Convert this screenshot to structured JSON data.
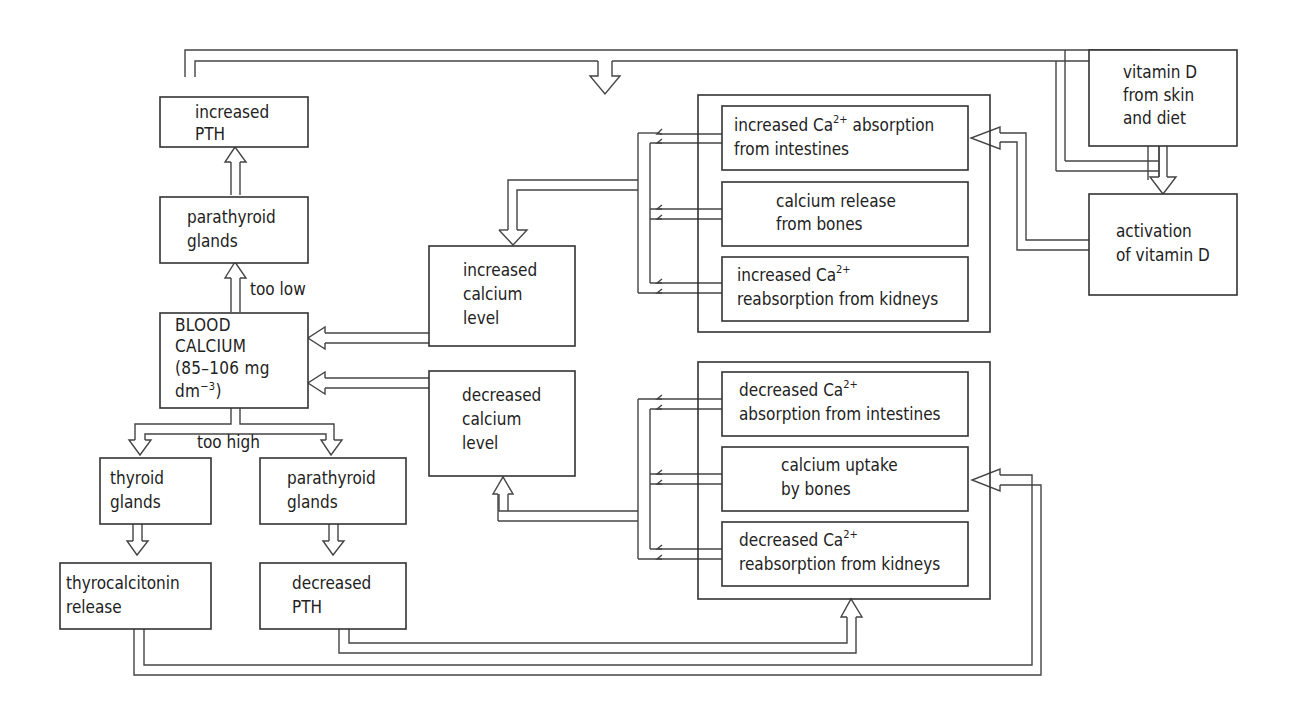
{
  "diagram": {
    "colors": {
      "line": "#444444",
      "box_border": "#333333",
      "text": "#222222",
      "background": "#ffffff"
    },
    "nodes": {
      "increased_pth": {
        "lines": [
          "increased",
          "PTH"
        ]
      },
      "parathyroid_glands_top": {
        "lines": [
          "parathyroid",
          "glands"
        ]
      },
      "blood_calcium": {
        "lines": [
          "BLOOD",
          "CALCIUM",
          "(85–106 mg",
          "dm"
        ],
        "superscript": "−3",
        "suffix": ")"
      },
      "thyroid_glands": {
        "lines": [
          "thyroid",
          "glands"
        ]
      },
      "parathyroid_glands_bottom": {
        "lines": [
          "parathyroid",
          "glands"
        ]
      },
      "thyrocalcitonin_release": {
        "lines": [
          "thyrocalcitonin",
          "release"
        ]
      },
      "decreased_pth": {
        "lines": [
          "decreased",
          "PTH"
        ]
      },
      "increased_calcium_level": {
        "lines": [
          "increased",
          "calcium",
          "level"
        ]
      },
      "decreased_calcium_level": {
        "lines": [
          "decreased",
          "calcium",
          "level"
        ]
      },
      "increased_absorption_intestines": {
        "line1_pre": "increased Ca",
        "line1_sup": "2+",
        "line1_post": " absorption",
        "line2": "from  intestines"
      },
      "calcium_release_bones": {
        "lines": [
          "calcium release",
          "from bones"
        ]
      },
      "increased_reabsorption_kidneys": {
        "line1_pre": "increased Ca",
        "line1_sup": "2+",
        "line2": "reabsorption from kidneys"
      },
      "decreased_absorption_intestines": {
        "line1_pre": "decreased Ca",
        "line1_sup": "2+",
        "line2": "absorption from intestines"
      },
      "calcium_uptake_bones": {
        "lines": [
          "calcium uptake",
          "by bones"
        ]
      },
      "decreased_reabsorption_kidneys": {
        "line1_pre": "decreased Ca",
        "line1_sup": "2+",
        "line2": "reabsorption from kidneys"
      },
      "vitamin_d_source": {
        "lines": [
          "vitamin D",
          "from skin",
          "and diet"
        ]
      },
      "activation_vitamin_d": {
        "lines": [
          "activation",
          "of vitamin D"
        ]
      }
    },
    "labels": {
      "too_low": "too low",
      "too_high": "too high"
    },
    "edges": [
      {
        "from": "blood_calcium",
        "to": "parathyroid_glands_top",
        "label": "too low"
      },
      {
        "from": "parathyroid_glands_top",
        "to": "increased_pth"
      },
      {
        "from": "increased_pth",
        "to": "increase_group"
      },
      {
        "from": "increased_pth",
        "to": "activation_vitamin_d"
      },
      {
        "from": "vitamin_d_source",
        "to": "activation_vitamin_d"
      },
      {
        "from": "activation_vitamin_d",
        "to": "increased_absorption_intestines"
      },
      {
        "from": "increase_group",
        "to": "increased_calcium_level"
      },
      {
        "from": "increased_calcium_level",
        "to": "blood_calcium"
      },
      {
        "from": "blood_calcium",
        "to": "thyroid_glands",
        "label": "too high"
      },
      {
        "from": "blood_calcium",
        "to": "parathyroid_glands_bottom",
        "label": "too high"
      },
      {
        "from": "thyroid_glands",
        "to": "thyrocalcitonin_release"
      },
      {
        "from": "parathyroid_glands_bottom",
        "to": "decreased_pth"
      },
      {
        "from": "decreased_pth",
        "to": "decrease_group"
      },
      {
        "from": "thyrocalcitonin_release",
        "to": "calcium_uptake_bones"
      },
      {
        "from": "decrease_group",
        "to": "decreased_calcium_level"
      },
      {
        "from": "decreased_calcium_level",
        "to": "blood_calcium"
      }
    ]
  }
}
